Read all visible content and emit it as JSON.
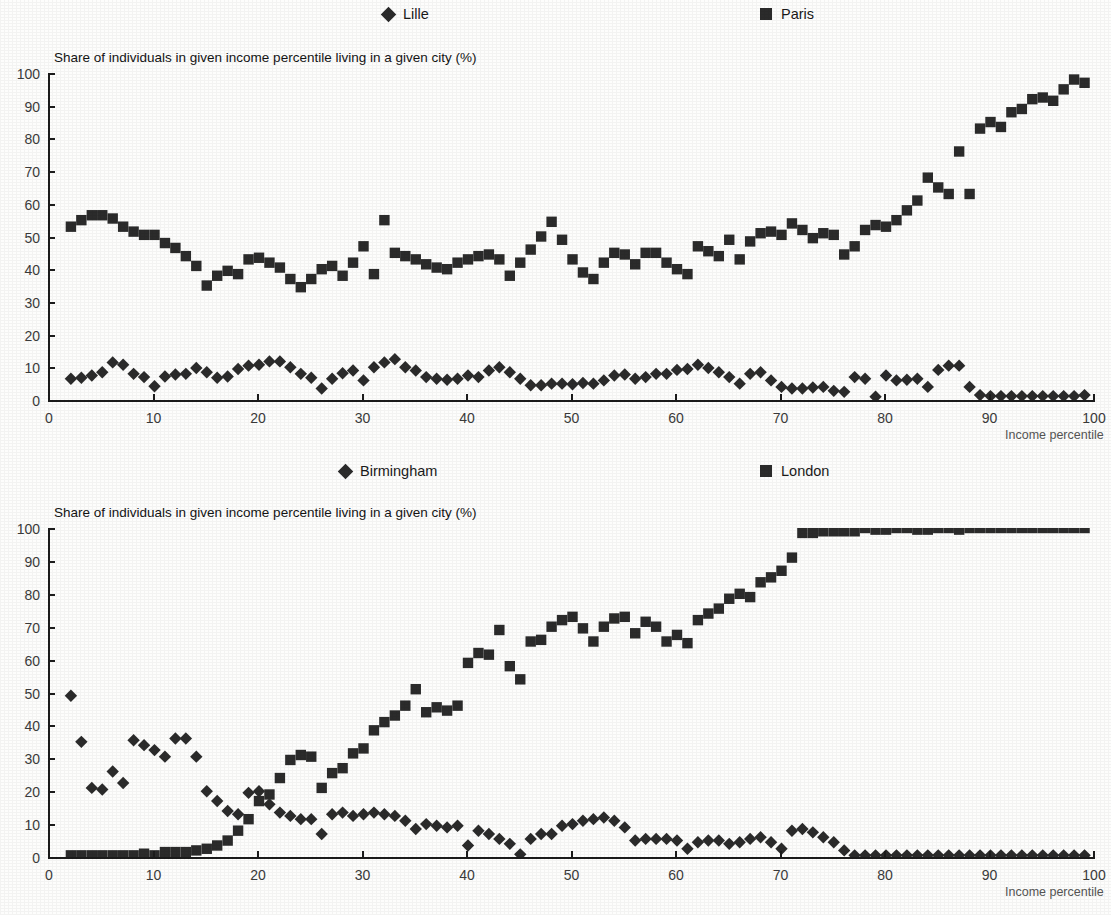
{
  "document": {
    "kind": "two-panel-scatter-figure",
    "marker_color": "#2b2b2b",
    "axis_color": "#1c1c1c",
    "background_color": "#fdfdfc"
  },
  "panels": [
    {
      "id": "panel-france",
      "title": "Share of individuals in given income percentile living in a given city (%)",
      "xlabel": "Income percentile",
      "legend": [
        {
          "label": "Lille",
          "marker": "diamond-marker-icon"
        },
        {
          "label": "Paris",
          "marker": "square-marker-icon"
        }
      ],
      "yticks": [
        "0",
        "10",
        "20",
        "30",
        "40",
        "50",
        "60",
        "70",
        "80",
        "90",
        "100"
      ],
      "xticks": [
        "0",
        "10",
        "20",
        "30",
        "40",
        "50",
        "60",
        "70",
        "80",
        "90",
        "100"
      ]
    },
    {
      "id": "panel-uk",
      "title": "Share of individuals in given income percentile living in a given city (%)",
      "xlabel": "Income percentile",
      "legend": [
        {
          "label": "Birmingham",
          "marker": "diamond-marker-icon"
        },
        {
          "label": "London",
          "marker": "square-marker-icon"
        }
      ],
      "yticks": [
        "0",
        "10",
        "20",
        "30",
        "40",
        "50",
        "60",
        "70",
        "80",
        "90",
        "100"
      ],
      "xticks": [
        "0",
        "10",
        "20",
        "30",
        "40",
        "50",
        "60",
        "70",
        "80",
        "90",
        "100"
      ]
    }
  ],
  "chart_data": [
    {
      "type": "scatter",
      "title": "Share of individuals in given income percentile living in a given city (%)",
      "xlabel": "Income percentile",
      "ylabel": "",
      "xlim": [
        0,
        100
      ],
      "ylim": [
        0,
        100
      ],
      "grid": false,
      "legend_position": "top",
      "x": [
        2,
        3,
        4,
        5,
        6,
        7,
        8,
        9,
        10,
        11,
        12,
        13,
        14,
        15,
        16,
        17,
        18,
        19,
        20,
        21,
        22,
        23,
        24,
        25,
        26,
        27,
        28,
        29,
        30,
        31,
        32,
        33,
        34,
        35,
        36,
        37,
        38,
        39,
        40,
        41,
        42,
        43,
        44,
        45,
        46,
        47,
        48,
        49,
        50,
        51,
        52,
        53,
        54,
        55,
        56,
        57,
        58,
        59,
        60,
        61,
        62,
        63,
        64,
        65,
        66,
        67,
        68,
        69,
        70,
        71,
        72,
        73,
        74,
        75,
        76,
        77,
        78,
        79,
        80,
        81,
        82,
        83,
        84,
        85,
        86,
        87,
        88,
        89,
        90,
        91,
        92,
        93,
        94,
        95,
        96,
        97,
        98,
        99
      ],
      "series": [
        {
          "name": "Lille",
          "marker": "diamond",
          "values": [
            6.5,
            6.8,
            7.5,
            8.5,
            11.5,
            10.8,
            8.0,
            7.0,
            4.2,
            7.2,
            7.8,
            8.0,
            9.8,
            8.5,
            6.8,
            7.2,
            9.5,
            10.5,
            10.8,
            11.8,
            11.8,
            10.0,
            8.0,
            6.8,
            3.5,
            6.5,
            8.2,
            9.0,
            6.0,
            10.0,
            11.5,
            12.5,
            10.0,
            9.0,
            7.0,
            6.5,
            6.2,
            6.5,
            7.5,
            7.0,
            9.0,
            10.0,
            8.5,
            6.5,
            4.5,
            4.5,
            5.0,
            5.0,
            4.8,
            5.2,
            5.0,
            6.0,
            7.5,
            7.8,
            6.5,
            7.0,
            8.0,
            8.0,
            9.2,
            9.5,
            10.8,
            9.8,
            8.5,
            7.0,
            5.0,
            8.0,
            8.5,
            6.0,
            4.0,
            3.5,
            3.5,
            3.8,
            4.0,
            2.8,
            2.5,
            7.0,
            6.5,
            1.0,
            7.5,
            6.0,
            6.2,
            6.5,
            4.0,
            9.2,
            10.5,
            10.5,
            4.0,
            1.5,
            1.2,
            1.2,
            1.2,
            1.2,
            1.2,
            1.2,
            1.2,
            1.2,
            1.2,
            1.5
          ]
        },
        {
          "name": "Paris",
          "marker": "square",
          "values": [
            53.0,
            55.0,
            56.5,
            56.5,
            55.5,
            53.0,
            51.5,
            50.5,
            50.5,
            48.0,
            46.5,
            44.0,
            41.0,
            35.0,
            38.0,
            39.5,
            38.5,
            43.0,
            43.5,
            42.0,
            40.5,
            37.0,
            34.5,
            37.0,
            40.0,
            41.0,
            38.0,
            42.0,
            47.0,
            38.5,
            55.0,
            45.0,
            44.0,
            43.0,
            41.5,
            40.5,
            40.0,
            42.0,
            43.0,
            44.0,
            44.5,
            43.0,
            38.0,
            42.0,
            46.0,
            50.0,
            54.5,
            49.0,
            43.0,
            39.0,
            37.0,
            42.0,
            45.0,
            44.5,
            41.5,
            45.0,
            45.0,
            42.0,
            40.0,
            38.5,
            47.0,
            45.5,
            44.0,
            49.0,
            43.0,
            48.5,
            51.0,
            51.5,
            50.5,
            54.0,
            52.0,
            49.5,
            51.0,
            50.5,
            44.5,
            47.0,
            52.0,
            53.5,
            53.0,
            55.0,
            58.0,
            61.0,
            68.0,
            65.0,
            63.0,
            76.0,
            63.0,
            83.0,
            85.0,
            83.5,
            88.0,
            89.0,
            92.0,
            92.5,
            91.5,
            95.0,
            98.0,
            97.0
          ]
        }
      ]
    },
    {
      "type": "scatter",
      "title": "Share of individuals in given income percentile living in a given city (%)",
      "xlabel": "Income percentile",
      "ylabel": "",
      "xlim": [
        0,
        100
      ],
      "ylim": [
        0,
        100
      ],
      "grid": false,
      "legend_position": "top",
      "x": [
        2,
        3,
        4,
        5,
        6,
        7,
        8,
        9,
        10,
        11,
        12,
        13,
        14,
        15,
        16,
        17,
        18,
        19,
        20,
        21,
        22,
        23,
        24,
        25,
        26,
        27,
        28,
        29,
        30,
        31,
        32,
        33,
        34,
        35,
        36,
        37,
        38,
        39,
        40,
        41,
        42,
        43,
        44,
        45,
        46,
        47,
        48,
        49,
        50,
        51,
        52,
        53,
        54,
        55,
        56,
        57,
        58,
        59,
        60,
        61,
        62,
        63,
        64,
        65,
        66,
        67,
        68,
        69,
        70,
        71,
        72,
        73,
        74,
        75,
        76,
        77,
        78,
        79,
        80,
        81,
        82,
        83,
        84,
        85,
        86,
        87,
        88,
        89,
        90,
        91,
        92,
        93,
        94,
        95,
        96,
        97,
        98,
        99
      ],
      "series": [
        {
          "name": "Birmingham",
          "marker": "diamond",
          "values": [
            49.0,
            35.0,
            21.0,
            20.5,
            26.0,
            22.5,
            35.5,
            34.0,
            32.5,
            30.5,
            36.0,
            36.0,
            30.5,
            20.0,
            17.0,
            14.0,
            13.0,
            19.5,
            20.0,
            16.0,
            13.5,
            12.5,
            11.5,
            11.5,
            7.0,
            13.0,
            13.5,
            12.5,
            13.0,
            13.5,
            13.0,
            12.5,
            11.0,
            8.5,
            10.0,
            9.5,
            9.0,
            9.5,
            3.5,
            8.0,
            7.0,
            5.5,
            4.0,
            0.8,
            5.5,
            7.0,
            7.0,
            9.5,
            10.0,
            11.0,
            11.5,
            12.0,
            11.0,
            9.0,
            5.0,
            5.5,
            5.5,
            5.5,
            5.0,
            2.5,
            4.5,
            5.0,
            5.0,
            4.0,
            4.5,
            5.5,
            6.0,
            4.5,
            2.5,
            8.0,
            8.5,
            7.5,
            6.0,
            4.5,
            2.0,
            0.5,
            0.5,
            0.5,
            0.5,
            0.5,
            0.5,
            0.5,
            0.5,
            0.5,
            0.5,
            0.5,
            0.5,
            0.5,
            0.5,
            0.5,
            0.5,
            0.5,
            0.5,
            0.5,
            0.5,
            0.5,
            0.5,
            0.5
          ]
        },
        {
          "name": "London",
          "marker": "square",
          "values": [
            0.5,
            0.5,
            0.5,
            0.5,
            0.5,
            0.5,
            0.5,
            1.0,
            0.5,
            1.5,
            1.5,
            1.5,
            2.0,
            2.5,
            3.5,
            5.0,
            8.0,
            11.5,
            17.0,
            19.0,
            24.0,
            29.5,
            31.0,
            30.5,
            21.0,
            25.5,
            27.0,
            31.5,
            33.0,
            38.5,
            41.0,
            43.0,
            46.0,
            51.0,
            44.0,
            45.5,
            44.5,
            46.0,
            59.0,
            62.0,
            61.5,
            69.0,
            58.0,
            54.0,
            65.5,
            66.0,
            70.0,
            72.0,
            73.0,
            69.5,
            65.5,
            70.0,
            72.5,
            73.0,
            68.0,
            71.5,
            70.0,
            65.5,
            67.5,
            65.0,
            72.0,
            74.0,
            75.5,
            78.5,
            80.0,
            79.0,
            83.5,
            85.0,
            87.0,
            91.0,
            98.5,
            98.5,
            99.0,
            99.0,
            99.0,
            99.0,
            100.0,
            99.5,
            99.5,
            100.0,
            100.0,
            99.5,
            99.5,
            100.0,
            100.0,
            99.5,
            100.0,
            100.0,
            100.0,
            100.0,
            100.0,
            100.0,
            100.0,
            100.0,
            100.0,
            100.0,
            100.0,
            100.0
          ]
        }
      ]
    }
  ]
}
